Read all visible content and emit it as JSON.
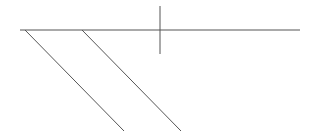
{
  "diagram": {
    "background": "#ffffff",
    "stroke_color": "#555555",
    "stroke_width": 1,
    "lines": [
      {
        "name": "horizontal-baseline",
        "x1": 20,
        "y1": 30,
        "x2": 300,
        "y2": 30
      },
      {
        "name": "vertical-tick",
        "x1": 160,
        "y1": 6,
        "x2": 160,
        "y2": 54
      },
      {
        "name": "diagonal-left",
        "x1": 25,
        "y1": 30,
        "x2": 124,
        "y2": 131
      },
      {
        "name": "diagonal-right",
        "x1": 82,
        "y1": 30,
        "x2": 181,
        "y2": 131
      }
    ]
  }
}
